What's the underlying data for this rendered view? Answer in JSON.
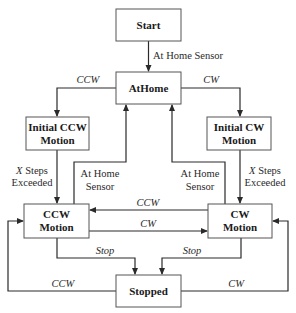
{
  "diagram": {
    "type": "state-machine",
    "states": [
      {
        "id": "start",
        "lines": [
          "Start"
        ]
      },
      {
        "id": "athome",
        "lines": [
          "AtHome"
        ]
      },
      {
        "id": "initial_ccw",
        "lines": [
          "Initial CCW",
          "Motion"
        ]
      },
      {
        "id": "initial_cw",
        "lines": [
          "Initial CW",
          "Motion"
        ]
      },
      {
        "id": "ccw_motion",
        "lines": [
          "CCW",
          "Motion"
        ]
      },
      {
        "id": "cw_motion",
        "lines": [
          "CW",
          "Motion"
        ]
      },
      {
        "id": "stopped",
        "lines": [
          "Stopped"
        ]
      }
    ],
    "transitions": [
      {
        "id": "start_to_athome",
        "from": "start",
        "to": "athome",
        "label": [
          "At Home Sensor"
        ],
        "italic": false
      },
      {
        "id": "athome_to_initial_ccw",
        "from": "athome",
        "to": "initial_ccw",
        "label": [
          "CCW"
        ],
        "italic": true
      },
      {
        "id": "athome_to_initial_cw",
        "from": "athome",
        "to": "initial_cw",
        "label": [
          "CW"
        ],
        "italic": true
      },
      {
        "id": "initial_ccw_to_ccw_motion",
        "from": "initial_ccw",
        "to": "ccw_motion",
        "label": [
          "X Steps",
          "Exceeded"
        ],
        "italic": false,
        "italic_prefix": "X"
      },
      {
        "id": "initial_cw_to_cw_motion",
        "from": "initial_cw",
        "to": "cw_motion",
        "label": [
          "X Steps",
          "Exceeded"
        ],
        "italic": false,
        "italic_prefix": "X"
      },
      {
        "id": "ccw_motion_to_athome",
        "from": "ccw_motion",
        "to": "athome",
        "label": [
          "At Home",
          "Sensor"
        ],
        "italic": false
      },
      {
        "id": "cw_motion_to_athome",
        "from": "cw_motion",
        "to": "athome",
        "label": [
          "At Home",
          "Sensor"
        ],
        "italic": false
      },
      {
        "id": "cw_motion_to_ccw_motion",
        "from": "cw_motion",
        "to": "ccw_motion",
        "label": [
          "CCW"
        ],
        "italic": true
      },
      {
        "id": "ccw_motion_to_cw_motion",
        "from": "ccw_motion",
        "to": "cw_motion",
        "label": [
          "CW"
        ],
        "italic": true
      },
      {
        "id": "ccw_motion_to_stopped",
        "from": "ccw_motion",
        "to": "stopped",
        "label": [
          "Stop"
        ],
        "italic": true
      },
      {
        "id": "cw_motion_to_stopped",
        "from": "cw_motion",
        "to": "stopped",
        "label": [
          "Stop"
        ],
        "italic": true
      },
      {
        "id": "stopped_to_ccw_motion",
        "from": "stopped",
        "to": "ccw_motion",
        "label": [
          "CCW"
        ],
        "italic": true
      },
      {
        "id": "stopped_to_cw_motion",
        "from": "stopped",
        "to": "cw_motion",
        "label": [
          "CW"
        ],
        "italic": true
      }
    ]
  }
}
